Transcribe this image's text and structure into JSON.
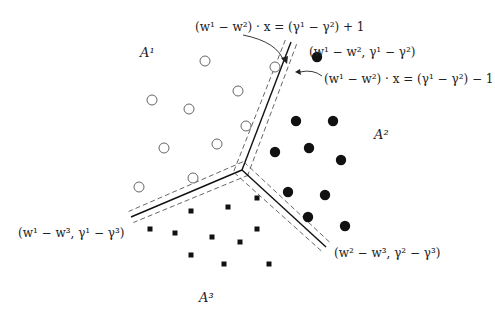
{
  "diagram": {
    "regions": [
      {
        "id": "A1",
        "label": "A¹",
        "x": 140,
        "y": 46
      },
      {
        "id": "A2",
        "label": "A²",
        "x": 374,
        "y": 130
      },
      {
        "id": "A3",
        "label": "A³",
        "x": 199,
        "y": 293
      }
    ],
    "labels": {
      "margin_plus": "(w¹ − w²) · x = (γ¹ − γ²) + 1",
      "boundary12": "(w¹ − w², γ¹ − γ²)",
      "margin_minus": "(w¹ − w²) · x = (γ¹ − γ²) − 1",
      "boundary13": "(w¹ − w³, γ¹ − γ³)",
      "boundary23": "(w² − w³, γ² − γ³)"
    },
    "junction": [
      242,
      170
    ],
    "boundaries": [
      {
        "name": "boundary-1-2",
        "end": [
          291,
          42
        ]
      },
      {
        "name": "boundary-1-3",
        "end": [
          131,
          217
        ]
      },
      {
        "name": "boundary-2-3",
        "end": [
          326,
          247
        ]
      }
    ],
    "points": {
      "class1_open_circles": [
        [
          205,
          61
        ],
        [
          275,
          67
        ],
        [
          152,
          100
        ],
        [
          189,
          109
        ],
        [
          238,
          91
        ],
        [
          246,
          126
        ],
        [
          164,
          148
        ],
        [
          217,
          144
        ],
        [
          139,
          187
        ],
        [
          193,
          178
        ]
      ],
      "class2_filled_circles": [
        [
          317,
          57
        ],
        [
          296,
          121
        ],
        [
          333,
          121
        ],
        [
          275,
          152
        ],
        [
          309,
          148
        ],
        [
          341,
          160
        ],
        [
          288,
          192
        ],
        [
          325,
          195
        ],
        [
          308,
          217
        ],
        [
          345,
          226
        ]
      ],
      "class3_squares": [
        [
          150,
          229
        ],
        [
          175,
          233
        ],
        [
          191,
          211
        ],
        [
          212,
          237
        ],
        [
          228,
          207
        ],
        [
          240,
          242
        ],
        [
          257,
          198
        ],
        [
          257,
          229
        ],
        [
          191,
          255
        ],
        [
          224,
          264
        ],
        [
          269,
          264
        ]
      ]
    },
    "colors": {
      "line": "#111111",
      "dash": "#555555",
      "point": "#111111"
    }
  }
}
